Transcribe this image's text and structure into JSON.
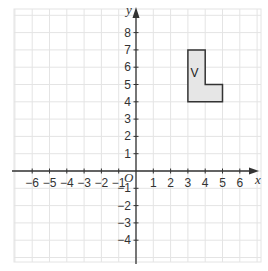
{
  "figure": {
    "x_axis": {
      "label": "x",
      "min": -6,
      "max": 6,
      "ticks": [
        "−6",
        "−5",
        "−4",
        "−3",
        "−2",
        "−1",
        "1",
        "2",
        "3",
        "4",
        "5",
        "6"
      ]
    },
    "y_axis": {
      "label": "y",
      "min": -4,
      "max": 8,
      "ticks": [
        "8",
        "7",
        "6",
        "5",
        "4",
        "3",
        "2",
        "1",
        "−1",
        "−2",
        "−3",
        "−4"
      ]
    },
    "origin_label": "O",
    "shape": {
      "label": "V",
      "vertices": [
        [
          3,
          4
        ],
        [
          3,
          7
        ],
        [
          4,
          7
        ],
        [
          4,
          5
        ],
        [
          5,
          5
        ],
        [
          5,
          4
        ]
      ],
      "fill": "#e6e6e6",
      "stroke": "#333333"
    },
    "colors": {
      "grid": "#e4e4e4",
      "axis": "#333333"
    }
  }
}
